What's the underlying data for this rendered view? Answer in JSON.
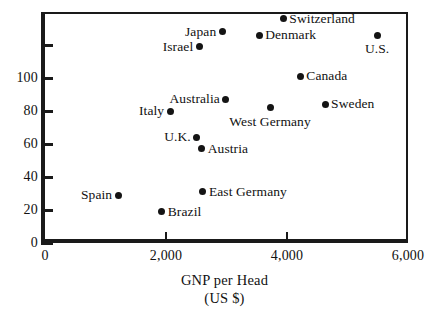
{
  "chart_data": {
    "type": "scatter",
    "title": "",
    "xlabel": "GNP per Head",
    "xlabel_units": "(US $)",
    "ylabel": "",
    "xlim": [
      0,
      6000
    ],
    "ylim": [
      0,
      140
    ],
    "grid": false,
    "legend": "none",
    "x_ticks": [
      {
        "value": 0,
        "label": "0"
      },
      {
        "value": 2000,
        "label": "2,000"
      },
      {
        "value": 4000,
        "label": "4,000"
      },
      {
        "value": 6000,
        "label": "6,000"
      }
    ],
    "y_ticks": [
      {
        "value": 0,
        "label": "0"
      },
      {
        "value": 20,
        "label": "20"
      },
      {
        "value": 40,
        "label": "40"
      },
      {
        "value": 60,
        "label": "60"
      },
      {
        "value": 80,
        "label": "80"
      },
      {
        "value": 100,
        "label": "100"
      },
      {
        "value": 120,
        "label": ""
      }
    ],
    "points": [
      {
        "label": "Switzerland",
        "x": 3940,
        "y": 136,
        "label_pos": "right"
      },
      {
        "label": "Denmark",
        "x": 3540,
        "y": 126,
        "label_pos": "right"
      },
      {
        "label": "U.S.",
        "x": 5490,
        "y": 126,
        "label_pos": "below"
      },
      {
        "label": "Japan",
        "x": 2930,
        "y": 128,
        "label_pos": "left"
      },
      {
        "label": "Israel",
        "x": 2550,
        "y": 119,
        "label_pos": "left"
      },
      {
        "label": "Canada",
        "x": 4220,
        "y": 101,
        "label_pos": "right"
      },
      {
        "label": "Australia",
        "x": 2990,
        "y": 87,
        "label_pos": "left"
      },
      {
        "label": "Sweden",
        "x": 4630,
        "y": 84,
        "label_pos": "right"
      },
      {
        "label": "West Germany",
        "x": 3720,
        "y": 82,
        "label_pos": "below"
      },
      {
        "label": "Italy",
        "x": 2070,
        "y": 80,
        "label_pos": "left"
      },
      {
        "label": "U.K.",
        "x": 2510,
        "y": 64,
        "label_pos": "left"
      },
      {
        "label": "Austria",
        "x": 2590,
        "y": 57,
        "label_pos": "right"
      },
      {
        "label": "East Germany",
        "x": 2610,
        "y": 31,
        "label_pos": "right"
      },
      {
        "label": "Spain",
        "x": 1210,
        "y": 29,
        "label_pos": "left"
      },
      {
        "label": "Brazil",
        "x": 1930,
        "y": 19,
        "label_pos": "right"
      }
    ],
    "colors": {
      "marker": "#141414",
      "axis": "#1a1a1a",
      "text": "#111111",
      "background": "#ffffff"
    }
  }
}
